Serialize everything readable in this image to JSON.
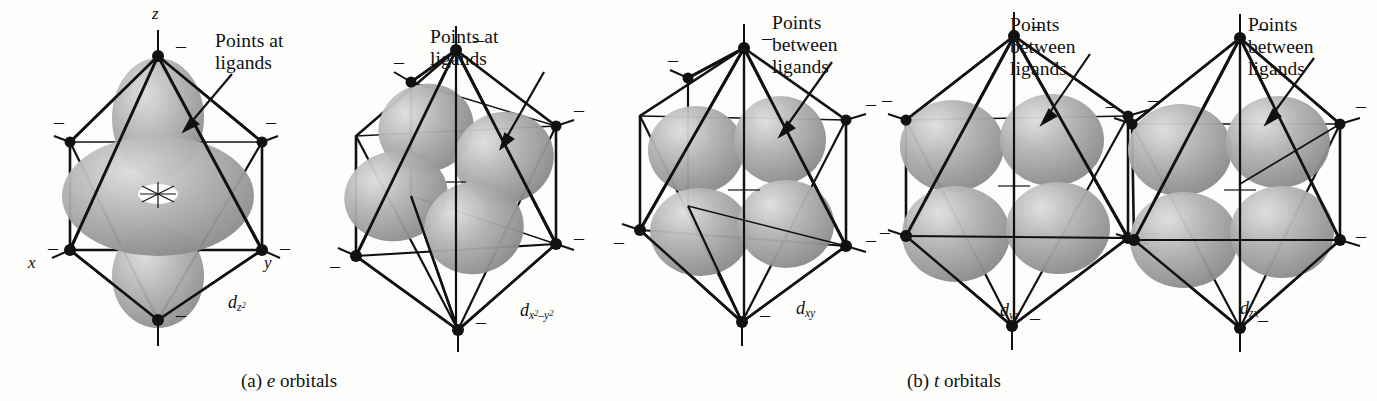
{
  "figure": {
    "background": "#fdfdfb",
    "ink": "#111111",
    "lobe_fill": "#a8a8a8",
    "lobe_highlight": "#d2d2d2",
    "lobe_shadow": "#7d7d7d"
  },
  "panels": [
    {
      "id": "dz2",
      "orbital_label_d": "d",
      "orbital_label_sub": "z",
      "orbital_label_sup": "2",
      "orbital_label_plain": "dz2",
      "annotation": "Points at\nligands",
      "axis_labels": [
        "z",
        "x",
        "y"
      ],
      "ligand_charge": "–",
      "ligand_count": 6,
      "group": "e"
    },
    {
      "id": "dx2-y2",
      "orbital_label_d": "d",
      "orbital_label_sub": "x",
      "orbital_label_sup": "2",
      "orbital_label_sub2": "–y",
      "orbital_label_sup2": "2",
      "orbital_label_plain": "dx2−y2",
      "annotation": "Points at\nligands",
      "axis_labels": [],
      "ligand_charge": "–",
      "ligand_count": 6,
      "group": "e"
    },
    {
      "id": "dxy",
      "orbital_label_d": "d",
      "orbital_label_sub": "xy",
      "orbital_label_plain": "dxy",
      "annotation": "Points\nbetween\nligands",
      "axis_labels": [],
      "ligand_charge": "–",
      "ligand_count": 6,
      "group": "t"
    },
    {
      "id": "dyz",
      "orbital_label_d": "d",
      "orbital_label_sub": "yz",
      "orbital_label_plain": "dyz",
      "annotation": "Points\nbetween\nligands",
      "axis_labels": [],
      "ligand_charge": "–",
      "ligand_count": 6,
      "group": "t"
    },
    {
      "id": "dzx",
      "orbital_label_d": "d",
      "orbital_label_sub": "zx",
      "orbital_label_plain": "dzx",
      "annotation": "Points\nbetween\nligands",
      "axis_labels": [],
      "ligand_charge": "–",
      "ligand_count": 6,
      "group": "t"
    }
  ],
  "captions": {
    "a_tag": "(a)",
    "a_italic": "e",
    "a_text": " orbitals",
    "b_tag": "(b)",
    "b_italic": "t",
    "b_text": " orbitals"
  }
}
